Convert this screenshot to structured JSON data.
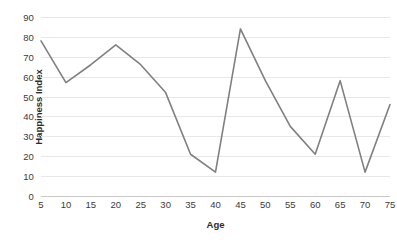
{
  "chart_data": {
    "type": "line",
    "title": "",
    "xlabel": "Age",
    "ylabel": "Happiness Index",
    "x": [
      5,
      10,
      15,
      20,
      25,
      30,
      35,
      40,
      45,
      50,
      55,
      60,
      65,
      70,
      75
    ],
    "categories": [
      "5",
      "10",
      "15",
      "20",
      "25",
      "30",
      "35",
      "40",
      "45",
      "50",
      "55",
      "60",
      "65",
      "70",
      "75"
    ],
    "values": [
      78,
      57,
      66,
      76,
      66,
      52,
      21,
      12,
      84,
      58,
      35,
      21,
      58,
      12,
      46
    ],
    "series": [
      {
        "name": "Happiness Index",
        "values": [
          78,
          57,
          66,
          76,
          66,
          52,
          21,
          12,
          84,
          58,
          35,
          21,
          58,
          12,
          46
        ]
      }
    ],
    "xlim": [
      5,
      75
    ],
    "ylim": [
      0,
      90
    ],
    "ytick_step": 10,
    "xtick_step": 5,
    "yticks": [
      "0",
      "10",
      "20",
      "30",
      "40",
      "50",
      "60",
      "70",
      "80",
      "90"
    ],
    "xticks": [
      "5",
      "10",
      "15",
      "20",
      "25",
      "30",
      "35",
      "40",
      "45",
      "50",
      "55",
      "60",
      "65",
      "70",
      "75"
    ],
    "grid": "horizontal",
    "legend": "none",
    "line_color": "#808080",
    "grid_color": "#e8e8e8",
    "axis_color": "#c9c9c9",
    "background_color": "#ffffff",
    "text_color": "#3b3b3b",
    "markers": false
  }
}
